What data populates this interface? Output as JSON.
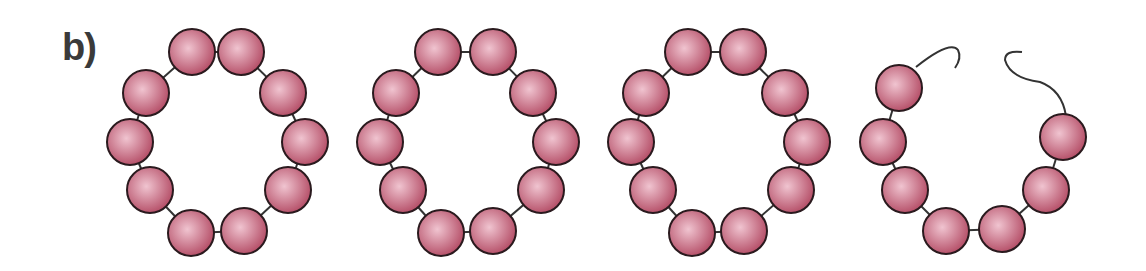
{
  "figure": {
    "panel_label": "b)",
    "bead_color": "#b0455f",
    "bead_highlight": "#f0c4d0",
    "bead_outline": "#2a1a1e",
    "link_color": "#333333",
    "bead_radius": 23,
    "rings": [
      {
        "name": "ring-1",
        "state": "closed",
        "beads": [
          [
            192,
            52
          ],
          [
            241,
            52
          ],
          [
            283,
            93
          ],
          [
            305,
            142
          ],
          [
            288,
            190
          ],
          [
            244,
            231
          ],
          [
            191,
            233
          ],
          [
            150,
            190
          ],
          [
            130,
            142
          ],
          [
            146,
            93
          ]
        ]
      },
      {
        "name": "ring-2",
        "state": "closed",
        "beads": [
          [
            438,
            52
          ],
          [
            493,
            52
          ],
          [
            533,
            93
          ],
          [
            556,
            142
          ],
          [
            541,
            190
          ],
          [
            493,
            231
          ],
          [
            441,
            233
          ],
          [
            403,
            190
          ],
          [
            380,
            142
          ],
          [
            396,
            93
          ]
        ]
      },
      {
        "name": "ring-3",
        "state": "closed",
        "beads": [
          [
            688,
            52
          ],
          [
            743,
            52
          ],
          [
            785,
            93
          ],
          [
            807,
            142
          ],
          [
            791,
            190
          ],
          [
            744,
            231
          ],
          [
            692,
            233
          ],
          [
            653,
            190
          ],
          [
            631,
            142
          ],
          [
            646,
            93
          ]
        ]
      },
      {
        "name": "ring-4",
        "state": "broken",
        "beads": [
          [
            899,
            88
          ],
          [
            883,
            142
          ],
          [
            905,
            190
          ],
          [
            946,
            231
          ],
          [
            1002,
            229
          ],
          [
            1046,
            190
          ],
          [
            1063,
            137
          ]
        ],
        "loose_ends": [
          "M 916 67 Q 950 40 958 50 Q 962 58 955 68",
          "M 1066 116 Q 1062 90 1040 82 Q 1010 78 1005 60 Q 1005 50 1022 52"
        ]
      }
    ]
  }
}
